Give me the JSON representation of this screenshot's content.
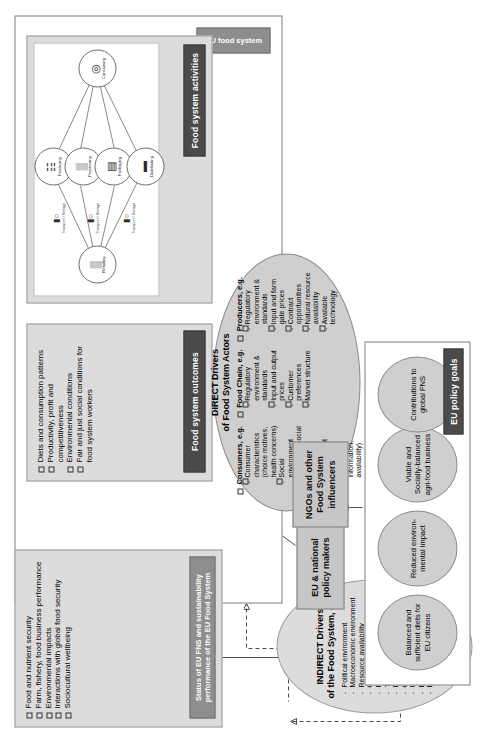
{
  "outcomes_panel": {
    "tab_label": "Food system outcomes",
    "items": [
      "Diets and consumption patterns",
      "Productivity, profit and competitiveness",
      "Environmental conditions",
      "Fair and just social conditions for food system workers"
    ]
  },
  "status_panel": {
    "tab_label": "Status of EU FNS and sustainability performance of the EU Food System",
    "items": [
      "Food and nutrient security",
      "Farm, fishery, food business performance",
      "Environmental impacts",
      "Interactions with global food security",
      "Sociocultural wellbeing"
    ]
  },
  "activities_panel": {
    "tab_label": "Food system activities",
    "nodes": [
      {
        "name": "Producing",
        "icon": "farm-icon",
        "glyph": "☷"
      },
      {
        "name": "Processing",
        "icon": "factory-icon",
        "glyph": "▒"
      },
      {
        "name": "Packaging",
        "icon": "package-icon",
        "glyph": "▤"
      },
      {
        "name": "Distributing",
        "icon": "truck-icon",
        "glyph": "▬"
      },
      {
        "name": "Retailing",
        "icon": "shop-icon",
        "glyph": "▒"
      },
      {
        "name": "Consuming",
        "icon": "plate-icon",
        "glyph": "◎"
      }
    ],
    "connectors": [
      {
        "label": "Transport / Storage",
        "icon": "transport-icon",
        "glyph": "⬛○"
      },
      {
        "label": "Transport / Storage",
        "icon": "transport-icon",
        "glyph": "⬛○"
      },
      {
        "label": "Transport / Storage",
        "icon": "transport-icon",
        "glyph": "⬛○"
      }
    ]
  },
  "direct_drivers": {
    "title_line1": "DIRECT Drivers",
    "title_line2": "of Food System Actors",
    "groups": [
      {
        "heading": "Consumers, e.g.",
        "items": [
          "Consumer characteristics (choice motives, health concerns)",
          "Social environment (cultural & social norms)",
          "Consumer environment (economic incentives, information, availability)"
        ]
      },
      {
        "heading": "Food Chain, e.g.",
        "items": [
          "Regulatory environment & standards",
          "Input and output prices",
          "Customer preferences",
          "Market structure"
        ]
      },
      {
        "heading": "Producers, e.g.",
        "items": [
          "Regulatory environment & standards",
          "Input and farm gate prices",
          "Contract opportunities",
          "Natural resource availability",
          "Available technology"
        ]
      }
    ]
  },
  "indirect_drivers": {
    "title_line1": "INDIRECT Drivers",
    "title_line2": "of the Food System, e.g.",
    "items": [
      "Political environment",
      "Macroeconomic environment",
      "Resource availability",
      "Climate change",
      "Public health drivers",
      "Technological innovation",
      "Demographics",
      "Culture/lifestyles",
      "Urbanisation",
      "Biofuel potential",
      "Energy price"
    ]
  },
  "actors": [
    {
      "id": "policy-makers",
      "label": "EU & national policy makers"
    },
    {
      "id": "ngos",
      "label": "NGOs and other Food System influencers"
    }
  ],
  "policy_goals": {
    "tab_label": "EU policy goals",
    "goals": [
      "Balanced and sufficient diets for EU citizens",
      "Reduced environ-mental impact",
      "Viable and Socially-balanced agri-food business",
      "Contributions to global FNS"
    ]
  },
  "system_label": {
    "eu_food_system": "EU food system"
  },
  "colors": {
    "panel_fill": "#cfcfcf",
    "panel_light": "#dcdcdc",
    "dark_tab": "#4a4a4a",
    "grey_tab": "#8e8e8e",
    "line": "#4d4d4d"
  }
}
